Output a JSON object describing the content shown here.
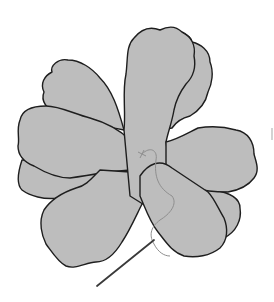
{
  "illustration": {
    "subject": "fabric flower with needle and thread",
    "petal_count": 8,
    "colors": {
      "petal_fill": "#bdbdbd",
      "outline": "#1e1e1e",
      "thread": "#8e8e8e",
      "needle": "#3a3a3a",
      "background": "#ffffff"
    }
  }
}
